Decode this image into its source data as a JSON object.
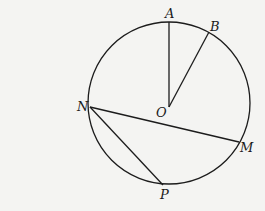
{
  "diagram": {
    "type": "circle-geometry",
    "circle": {
      "center": "O",
      "cx": 169,
      "cy": 103,
      "r": 81
    },
    "points": {
      "A": {
        "x": 169,
        "y": 22,
        "label": "A",
        "lx": 165,
        "ly": 18
      },
      "B": {
        "x": 209,
        "y": 32,
        "label": "B",
        "lx": 210,
        "ly": 31
      },
      "O": {
        "x": 169,
        "y": 107,
        "label": "O",
        "lx": 156,
        "ly": 117
      },
      "N": {
        "x": 90,
        "y": 107,
        "label": "N",
        "lx": 77,
        "ly": 111
      },
      "M": {
        "x": 239,
        "y": 142,
        "label": "M",
        "lx": 240,
        "ly": 152
      },
      "P": {
        "x": 163,
        "y": 185,
        "label": "P",
        "lx": 160,
        "ly": 199
      }
    },
    "segments": [
      {
        "from": "O",
        "to": "A"
      },
      {
        "from": "O",
        "to": "B"
      },
      {
        "from": "N",
        "to": "M"
      },
      {
        "from": "N",
        "to": "P"
      }
    ],
    "labels": [
      "A",
      "B",
      "O",
      "N",
      "M",
      "P"
    ]
  }
}
